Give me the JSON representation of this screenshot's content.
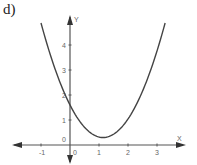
{
  "panel_label": "d)",
  "chart_data": {
    "type": "line",
    "title": "",
    "xlabel": "X",
    "ylabel": "Y",
    "xlim": [
      -1.5,
      3.9
    ],
    "ylim": [
      -0.7,
      5.2
    ],
    "x_ticks": [
      -1,
      0,
      1,
      2,
      3
    ],
    "x_tick_labels": [
      "-1",
      "0",
      "1",
      "2",
      "3"
    ],
    "y_ticks": [
      0,
      1,
      2,
      3,
      4
    ],
    "y_tick_labels": [
      "0",
      "1",
      "2",
      "3",
      "4"
    ],
    "grid": false,
    "legend": null,
    "series": [
      {
        "name": "parabola",
        "description": "upward-opening parabola, approx y = (x - 1.14)^2 + 0.3",
        "x": [
          -1.0,
          -0.5,
          0.0,
          0.5,
          1.0,
          1.14,
          1.5,
          2.0,
          2.5,
          3.0,
          3.28
        ],
        "y": [
          4.88,
          2.99,
          1.6,
          0.71,
          0.32,
          0.3,
          0.43,
          1.04,
          2.15,
          3.76,
          4.88
        ]
      }
    ],
    "color": "#444444"
  }
}
